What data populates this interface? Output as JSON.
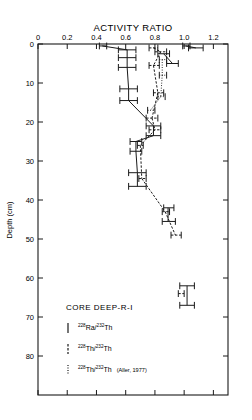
{
  "chart_data": {
    "type": "scatter",
    "title": "ACTIVITY RATIO",
    "xlabel": "ACTIVITY RATIO",
    "ylabel": "Depth (cm)",
    "xlim": [
      0,
      1.3
    ],
    "ylim": [
      0,
      90
    ],
    "grid": false,
    "legend_position": "inside-bottom-left",
    "x_ticks": [
      "0",
      "0.2",
      "0.4",
      "0.6",
      "0.8",
      "1.0",
      "1.2"
    ],
    "x_tick_values": [
      0,
      0.2,
      0.4,
      0.6,
      0.8,
      1.0,
      1.2
    ],
    "y_ticks": [
      "0",
      "10",
      "20",
      "30",
      "40",
      "50",
      "60",
      "70",
      "80"
    ],
    "y_tick_values": [
      0,
      10,
      20,
      30,
      40,
      50,
      60,
      70,
      80
    ],
    "series": [
      {
        "name": "228Ra/232Th",
        "style": "solid",
        "points": [
          {
            "depth": 0.5,
            "value": 0.44,
            "low": 0.42,
            "high": 0.47
          },
          {
            "depth": 1.5,
            "value": 0.61,
            "low": 0.55,
            "high": 0.67
          },
          {
            "depth": 3.5,
            "value": 0.61,
            "low": 0.55,
            "high": 0.67
          },
          {
            "depth": 6.0,
            "value": 0.61,
            "low": 0.55,
            "high": 0.67
          },
          {
            "depth": 11.5,
            "value": 0.62,
            "low": 0.56,
            "high": 0.68
          },
          {
            "depth": 14.5,
            "value": 0.62,
            "low": 0.56,
            "high": 0.68
          },
          {
            "depth": 21.0,
            "value": 0.79,
            "low": 0.74,
            "high": 0.84
          },
          {
            "depth": 23.5,
            "value": 0.79,
            "low": 0.74,
            "high": 0.84
          },
          {
            "depth": 25.0,
            "value": 0.67,
            "low": 0.63,
            "high": 0.71
          },
          {
            "depth": 27.5,
            "value": 0.67,
            "low": 0.63,
            "high": 0.71
          },
          {
            "depth": 33.0,
            "value": 0.68,
            "low": 0.62,
            "high": 0.74
          },
          {
            "depth": 36.5,
            "value": 0.68,
            "low": 0.62,
            "high": 0.74
          },
          {
            "depth": 42.0,
            "value": 0.89,
            "low": 0.86,
            "high": 0.93
          },
          {
            "depth": 45.5,
            "value": 0.89,
            "low": 0.85,
            "high": 0.94
          },
          {
            "depth": 62.0,
            "value": 1.02,
            "low": 0.97,
            "high": 1.07
          },
          {
            "depth": 67.0,
            "value": 1.02,
            "low": 0.97,
            "high": 1.07
          },
          {
            "depth": 0.5,
            "value": 1.01,
            "low": 0.99,
            "high": 1.04
          },
          {
            "depth": 1.0,
            "value": 1.08,
            "low": 1.03,
            "high": 1.13
          },
          {
            "depth": 2.5,
            "value": 0.86,
            "low": 0.82,
            "high": 0.9
          },
          {
            "depth": 5.0,
            "value": 0.92,
            "low": 0.88,
            "high": 0.96
          }
        ]
      },
      {
        "name": "228Th/232Th",
        "style": "dashed",
        "points": [
          {
            "depth": 1.0,
            "value": 0.79,
            "low": 0.76,
            "high": 0.82
          },
          {
            "depth": 2.0,
            "value": 0.84,
            "low": 0.8,
            "high": 0.88
          },
          {
            "depth": 5.5,
            "value": 0.79,
            "low": 0.76,
            "high": 0.83
          },
          {
            "depth": 12.5,
            "value": 0.82,
            "low": 0.79,
            "high": 0.86
          },
          {
            "depth": 19.0,
            "value": 0.78,
            "low": 0.74,
            "high": 0.82
          },
          {
            "depth": 22.0,
            "value": 0.8,
            "low": 0.76,
            "high": 0.84
          },
          {
            "depth": 26.0,
            "value": 0.7,
            "low": 0.68,
            "high": 0.72
          },
          {
            "depth": 34.5,
            "value": 0.71,
            "low": 0.69,
            "high": 0.74
          },
          {
            "depth": 43.0,
            "value": 0.87,
            "low": 0.85,
            "high": 0.9
          },
          {
            "depth": 49.0,
            "value": 0.94,
            "low": 0.91,
            "high": 0.98
          },
          {
            "depth": 64.0,
            "value": 0.98,
            "low": 0.96,
            "high": 1.0
          }
        ]
      },
      {
        "name": "228Th/232Th (Aller, 1977)",
        "style": "dotted",
        "points": [
          {
            "depth": 4.0,
            "value": 0.85,
            "low": 0.83,
            "high": 0.88
          },
          {
            "depth": 8.0,
            "value": 0.85,
            "low": 0.83,
            "high": 0.88
          },
          {
            "depth": 13.5,
            "value": 0.84,
            "low": 0.82,
            "high": 0.87
          },
          {
            "depth": 17.0,
            "value": 0.77,
            "low": 0.75,
            "high": 0.8
          }
        ]
      }
    ],
    "annotation": "CORE DEEP-R-I"
  },
  "axes": {
    "title": "ACTIVITY RATIO",
    "y_label": "Depth (cm)",
    "x_tick_labels": [
      "0",
      "0.2",
      "0.4",
      "0.6",
      "0.8",
      "1.0",
      "1.2"
    ],
    "y_tick_labels": [
      "0",
      "10",
      "20",
      "30",
      "40",
      "50",
      "60",
      "70",
      "80"
    ]
  },
  "legend": {
    "core_label": "CORE DEEP-R-I",
    "entries": [
      {
        "marker": "solid-line-marker",
        "sup1": "228",
        "el1": "Ra/",
        "sup2": "232",
        "el2": "Th",
        "cite": ""
      },
      {
        "marker": "dashed-line-marker",
        "sup1": "228",
        "el1": "Th/",
        "sup2": "232",
        "el2": "Th",
        "cite": ""
      },
      {
        "marker": "dotted-line-marker",
        "sup1": "228",
        "el1": "Th/",
        "sup2": "232",
        "el2": "Th",
        "cite": "(Aller, 1977)"
      }
    ]
  },
  "colors": {
    "ink": "#1a1a1a",
    "background": "#ffffff"
  }
}
